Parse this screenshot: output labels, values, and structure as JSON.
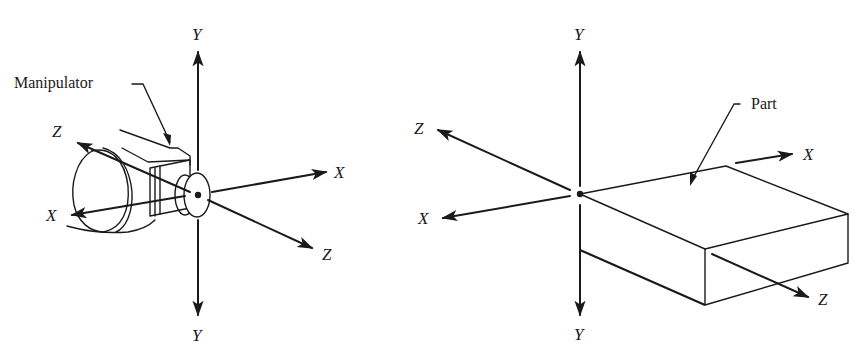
{
  "figure": {
    "panels": [
      {
        "id": "tool-frame",
        "callout": "Manipulator",
        "axes": {
          "y_up": "Y",
          "y_down": "Y",
          "x_right": "X",
          "x_left": "X",
          "z_back": "Z",
          "z_front": "Z"
        }
      },
      {
        "id": "part-frame",
        "callout": "Part",
        "axes": {
          "y_up": "Y",
          "y_down": "Y",
          "x_right": "X",
          "x_left": "X",
          "z_back": "Z",
          "z_front": "Z"
        }
      }
    ],
    "colors": {
      "ink": "#1a1a1a",
      "background": "#ffffff"
    }
  }
}
